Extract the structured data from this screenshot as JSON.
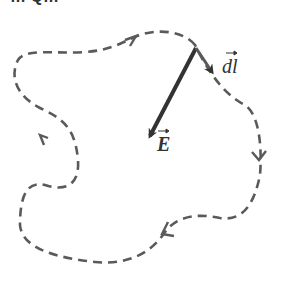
{
  "header": {
    "cut_text": "… Q…"
  },
  "diagram": {
    "labels": {
      "dl": "dl",
      "E": "E"
    },
    "colors": {
      "path": "#5a5a5a",
      "vector": "#333333"
    }
  }
}
